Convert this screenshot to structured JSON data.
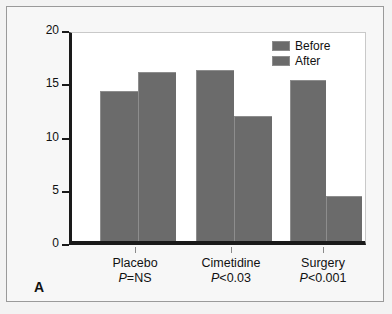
{
  "figure": {
    "panel_label": "A",
    "background_color": "#f3f3f3",
    "plot_background_color": "#ffffff",
    "axis_color": "#1a1a1a"
  },
  "chart_data": {
    "type": "bar",
    "title": "",
    "xlabel": "",
    "ylabel": "Medication score",
    "ylim": [
      0,
      20
    ],
    "yticks": [
      0,
      5,
      10,
      15,
      20
    ],
    "ytick_labels": [
      "0",
      "5",
      "10",
      "15",
      "20"
    ],
    "grid": false,
    "legend_position": "top-right",
    "categories": [
      "Placebo",
      "Cimetidine",
      "Surgery"
    ],
    "category_annotations": [
      "P=NS",
      "P<0.03",
      "P<0.001"
    ],
    "series": [
      {
        "name": "Before",
        "color": "#6b6b6b",
        "values": [
          14.1,
          16.1,
          15.1
        ]
      },
      {
        "name": "After",
        "color": "#6b6b6b",
        "values": [
          15.9,
          11.7,
          4.2
        ]
      }
    ]
  },
  "legend": {
    "items": [
      {
        "label": "Before",
        "color": "#6b6b6b"
      },
      {
        "label": "After",
        "color": "#6b6b6b"
      }
    ]
  }
}
